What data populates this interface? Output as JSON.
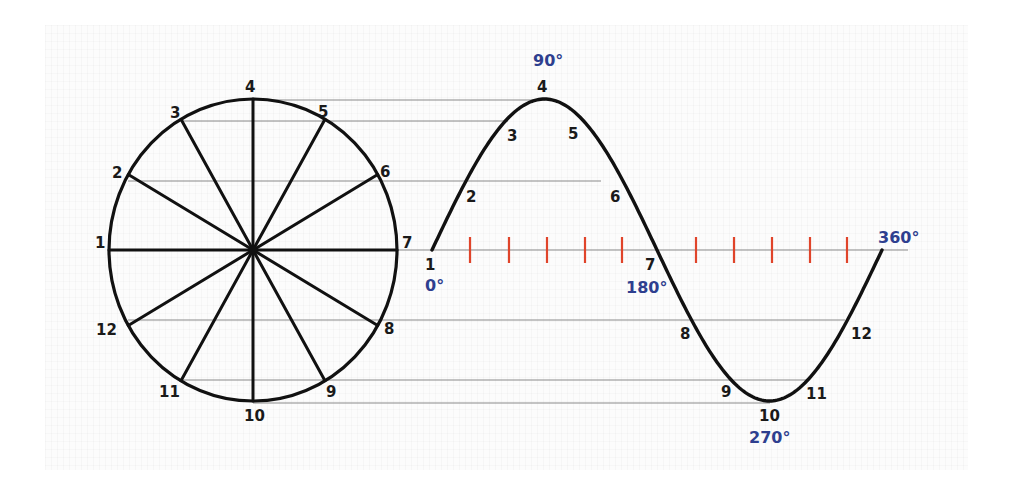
{
  "diagram": {
    "colors": {
      "stroke": "#111111",
      "projection_line": "#8a8a8a",
      "tick": "#e0442a",
      "degree_label": "#2e3f8f",
      "point_label": "#1a1a1a",
      "background": "#ffffff"
    },
    "circle": {
      "cx": 253,
      "cy": 250,
      "rx": 144,
      "ry": 151,
      "points": [
        {
          "label": "1",
          "angle_deg": 180,
          "lx": 95,
          "ly": 248
        },
        {
          "label": "2",
          "angle_deg": 150,
          "lx": 112,
          "ly": 178
        },
        {
          "label": "3",
          "angle_deg": 120,
          "lx": 170,
          "ly": 118
        },
        {
          "label": "4",
          "angle_deg": 90,
          "lx": 245,
          "ly": 92
        },
        {
          "label": "5",
          "angle_deg": 60,
          "lx": 318,
          "ly": 117
        },
        {
          "label": "6",
          "angle_deg": 30,
          "lx": 380,
          "ly": 177
        },
        {
          "label": "7",
          "angle_deg": 0,
          "lx": 402,
          "ly": 248
        },
        {
          "label": "8",
          "angle_deg": -30,
          "lx": 384,
          "ly": 334
        },
        {
          "label": "9",
          "angle_deg": -60,
          "lx": 326,
          "ly": 397
        },
        {
          "label": "10",
          "angle_deg": -90,
          "lx": 244,
          "ly": 421
        },
        {
          "label": "11",
          "angle_deg": -120,
          "lx": 159,
          "ly": 397
        },
        {
          "label": "12",
          "angle_deg": -150,
          "lx": 96,
          "ly": 335
        }
      ]
    },
    "wave": {
      "x_start": 432,
      "x_end": 882,
      "axis_y": 250,
      "axis_end_x": 908,
      "amplitude": 151,
      "points": [
        {
          "label": "1",
          "lx": 425,
          "ly": 270
        },
        {
          "label": "2",
          "lx": 466,
          "ly": 202
        },
        {
          "label": "3",
          "lx": 507,
          "ly": 141
        },
        {
          "label": "4",
          "lx": 537,
          "ly": 92
        },
        {
          "label": "5",
          "lx": 568,
          "ly": 139
        },
        {
          "label": "6",
          "lx": 610,
          "ly": 202
        },
        {
          "label": "7",
          "lx": 645,
          "ly": 270
        },
        {
          "label": "8",
          "lx": 680,
          "ly": 339
        },
        {
          "label": "9",
          "lx": 721,
          "ly": 397
        },
        {
          "label": "10",
          "lx": 759,
          "ly": 421
        },
        {
          "label": "11",
          "lx": 806,
          "ly": 399
        },
        {
          "label": "12",
          "lx": 851,
          "ly": 339
        }
      ],
      "degree_labels": [
        {
          "text": "0°",
          "x": 425,
          "y": 291
        },
        {
          "text": "90°",
          "x": 533,
          "y": 66
        },
        {
          "text": "180°",
          "x": 626,
          "y": 293
        },
        {
          "text": "270°",
          "x": 749,
          "y": 443
        },
        {
          "text": "360°",
          "x": 878,
          "y": 243
        }
      ],
      "ticks_x": [
        470,
        509,
        547,
        585,
        622,
        696,
        734,
        772,
        810,
        847
      ]
    },
    "projection_lines": [
      {
        "from_point": "4",
        "y": 100,
        "x1": 253,
        "x2": 545
      },
      {
        "from_point": "3",
        "y": 121,
        "x1": 182,
        "x2": 508
      },
      {
        "from_point": "2",
        "y": 181,
        "x1": 128,
        "x2": 601
      },
      {
        "from_point": "1-7",
        "y": 250,
        "x1": 397,
        "x2": 908
      },
      {
        "from_point": "12",
        "y": 320,
        "x1": 128,
        "x2": 845
      },
      {
        "from_point": "11",
        "y": 380,
        "x1": 182,
        "x2": 807
      },
      {
        "from_point": "10",
        "y": 403,
        "x1": 253,
        "x2": 770
      }
    ]
  }
}
